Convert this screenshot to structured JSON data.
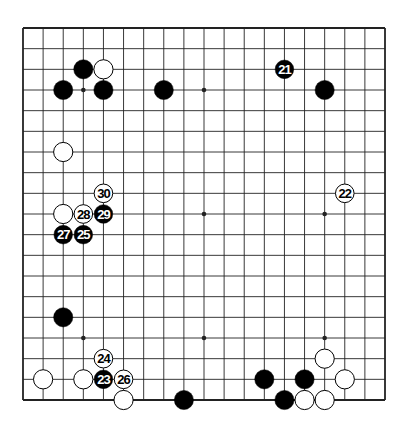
{
  "diagram": {
    "type": "go-board",
    "size": 19,
    "geometry": {
      "left": 23,
      "top": 28,
      "right": 385,
      "bottom": 400
    },
    "colors": {
      "line": "#222222",
      "black": "#000000",
      "white": "#ffffff",
      "background": "#ffffff"
    },
    "star_points": [
      [
        3,
        3
      ],
      [
        9,
        3
      ],
      [
        15,
        3
      ],
      [
        3,
        9
      ],
      [
        9,
        9
      ],
      [
        15,
        9
      ],
      [
        3,
        15
      ],
      [
        9,
        15
      ],
      [
        15,
        15
      ]
    ],
    "stones": [
      {
        "col": 3,
        "row": 2,
        "color": "black",
        "label": ""
      },
      {
        "col": 4,
        "row": 2,
        "color": "white",
        "label": ""
      },
      {
        "col": 2,
        "row": 3,
        "color": "black",
        "label": ""
      },
      {
        "col": 4,
        "row": 3,
        "color": "black",
        "label": ""
      },
      {
        "col": 7,
        "row": 3,
        "color": "black",
        "label": ""
      },
      {
        "col": 13,
        "row": 2,
        "color": "black",
        "label": "21"
      },
      {
        "col": 15,
        "row": 3,
        "color": "black",
        "label": ""
      },
      {
        "col": 2,
        "row": 6,
        "color": "white",
        "label": ""
      },
      {
        "col": 4,
        "row": 8,
        "color": "white",
        "label": "30"
      },
      {
        "col": 16,
        "row": 8,
        "color": "white",
        "label": "22"
      },
      {
        "col": 2,
        "row": 9,
        "color": "white",
        "label": ""
      },
      {
        "col": 3,
        "row": 9,
        "color": "white",
        "label": "28"
      },
      {
        "col": 4,
        "row": 9,
        "color": "black",
        "label": "29"
      },
      {
        "col": 2,
        "row": 10,
        "color": "black",
        "label": "27"
      },
      {
        "col": 3,
        "row": 10,
        "color": "black",
        "label": "25"
      },
      {
        "col": 2,
        "row": 14,
        "color": "black",
        "label": ""
      },
      {
        "col": 4,
        "row": 16,
        "color": "white",
        "label": "24"
      },
      {
        "col": 1,
        "row": 17,
        "color": "white",
        "label": ""
      },
      {
        "col": 3,
        "row": 17,
        "color": "white",
        "label": ""
      },
      {
        "col": 4,
        "row": 17,
        "color": "black",
        "label": "23"
      },
      {
        "col": 5,
        "row": 17,
        "color": "white",
        "label": "26"
      },
      {
        "col": 5,
        "row": 18,
        "color": "white",
        "label": ""
      },
      {
        "col": 8,
        "row": 18,
        "color": "black",
        "label": ""
      },
      {
        "col": 15,
        "row": 16,
        "color": "white",
        "label": ""
      },
      {
        "col": 12,
        "row": 17,
        "color": "black",
        "label": ""
      },
      {
        "col": 14,
        "row": 17,
        "color": "black",
        "label": ""
      },
      {
        "col": 16,
        "row": 17,
        "color": "white",
        "label": ""
      },
      {
        "col": 13,
        "row": 18,
        "color": "black",
        "label": ""
      },
      {
        "col": 14,
        "row": 18,
        "color": "white",
        "label": ""
      },
      {
        "col": 15,
        "row": 18,
        "color": "white",
        "label": ""
      }
    ]
  }
}
